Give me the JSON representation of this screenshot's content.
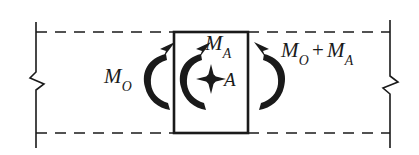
{
  "figure": {
    "background_color": "#ffffff",
    "line_color": "#1a1a1a"
  },
  "labels": {
    "left_moment": {
      "symbol": "M",
      "subscript": "O",
      "text": "M_O"
    },
    "disk_moment": {
      "symbol": "M",
      "subscript": "A",
      "text": "M_A"
    },
    "right_moment": {
      "first_symbol": "M",
      "first_subscript": "O",
      "operator": "+",
      "second_symbol": "M",
      "second_subscript": "A",
      "text": "M_O + M_A"
    },
    "point": {
      "text": "A"
    }
  },
  "elements": {
    "left_break_line": "break-line-left",
    "right_break_line": "break-line-right",
    "top_shaft_outline": "dashed-shaft-top",
    "bottom_shaft_outline": "dashed-shaft-bottom",
    "disk_rectangle": "disk-block",
    "point_marker": "point-a-marker",
    "arrow_left": "torque-arrow-counterclockwise-left",
    "arrow_center": "torque-arrow-counterclockwise-center",
    "arrow_right": "torque-arrow-clockwise-right"
  },
  "geometry": {
    "canvas": {
      "width": 419,
      "height": 155
    },
    "shaft": {
      "top_y": 32,
      "bottom_y": 133,
      "left_x": 36,
      "right_x": 390
    },
    "disk": {
      "left_x": 174,
      "right_x": 248,
      "top_y": 32,
      "bottom_y": 133
    },
    "point_a": {
      "x": 211,
      "y": 79
    }
  }
}
